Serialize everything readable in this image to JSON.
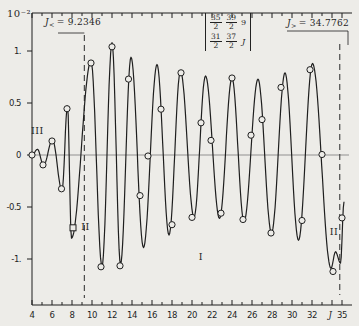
{
  "figure": {
    "scale_label": "10⁻²",
    "left_annotation": {
      "base": "J",
      "sub": "<",
      "rest": "= 9.2346"
    },
    "right_annotation": {
      "base": "J",
      "sub": ">",
      "rest": "= 34.7762"
    },
    "sixj_symbol": {
      "columns": [
        {
          "top": "35/2",
          "bottom": "31/2"
        },
        {
          "top": "39/2",
          "bottom": "37/2"
        },
        {
          "top": "9",
          "bottom": "J"
        }
      ]
    },
    "region_labels": [
      {
        "text": "III",
        "J": 4.55,
        "v": 0.235
      },
      {
        "text": "II",
        "J": 9.35,
        "v": -0.69
      },
      {
        "text": "I",
        "J": 20.9,
        "v": -0.98
      },
      {
        "text": "II",
        "J": 34.2,
        "v": -0.74
      }
    ]
  },
  "chart_data": {
    "type": "line",
    "xlabel": "J",
    "ylabel": "10^-2",
    "xlim": [
      4,
      35
    ],
    "ylim": [
      -1.37,
      1.37
    ],
    "grid": "zero-line only",
    "turning_points": {
      "J_less": 9.2346,
      "J_greater": 34.7762
    },
    "x_ticks_labeled": [
      {
        "label": "4",
        "J": 4
      },
      {
        "label": "6",
        "J": 6
      },
      {
        "label": "8",
        "J": 8
      },
      {
        "label": "10",
        "J": 10
      },
      {
        "label": "12",
        "J": 12
      },
      {
        "label": "14",
        "J": 14
      },
      {
        "label": "16",
        "J": 16
      },
      {
        "label": "18",
        "J": 18
      },
      {
        "label": "20",
        "J": 20
      },
      {
        "label": "22",
        "J": 22
      },
      {
        "label": "24",
        "J": 24
      },
      {
        "label": "26",
        "J": 26
      },
      {
        "label": "28",
        "J": 28
      },
      {
        "label": "30",
        "J": 30
      },
      {
        "label": "32",
        "J": 32
      },
      {
        "label": "J",
        "J": 33.8,
        "italic": true
      },
      {
        "label": "35",
        "J": 35
      }
    ],
    "y_ticks": [
      {
        "label": "1.",
        "v": 1
      },
      {
        "label": "0.5",
        "v": 0.5
      },
      {
        "label": "0",
        "v": 0
      },
      {
        "label": "-0.5",
        "v": -0.5
      },
      {
        "label": "-1.",
        "v": -1
      }
    ],
    "curve_extrema": [
      [
        4.0,
        0.0
      ],
      [
        4.55,
        0.055
      ],
      [
        5.15,
        -0.1
      ],
      [
        6.05,
        0.145
      ],
      [
        7.0,
        -0.34
      ],
      [
        7.55,
        0.47
      ],
      [
        7.95,
        -0.8
      ],
      [
        9.9,
        0.9
      ],
      [
        11.0,
        -1.07
      ],
      [
        12.0,
        1.08
      ],
      [
        12.85,
        -1.05
      ],
      [
        13.9,
        0.94
      ],
      [
        15.15,
        -0.89
      ],
      [
        16.5,
        0.87
      ],
      [
        17.7,
        -0.77
      ],
      [
        18.85,
        0.81
      ],
      [
        20.2,
        -0.6
      ],
      [
        21.35,
        0.76
      ],
      [
        22.75,
        -0.61
      ],
      [
        24.0,
        0.74
      ],
      [
        25.2,
        -0.64
      ],
      [
        26.6,
        0.73
      ],
      [
        27.95,
        -0.75
      ],
      [
        29.3,
        0.79
      ],
      [
        30.65,
        -0.82
      ],
      [
        32.05,
        0.88
      ],
      [
        33.9,
        -1.09
      ],
      [
        34.35,
        -0.93
      ],
      [
        34.85,
        -1.04
      ],
      [
        35.2,
        -0.45
      ]
    ],
    "exact_points": [
      [
        4.0,
        0.0
      ],
      [
        5.1,
        -0.095
      ],
      [
        6.0,
        0.135
      ],
      [
        6.95,
        -0.325
      ],
      [
        7.5,
        0.445
      ],
      [
        9.9,
        0.885
      ],
      [
        10.9,
        -1.075
      ],
      [
        12.0,
        1.04
      ],
      [
        12.8,
        -1.065
      ],
      [
        13.65,
        0.73
      ],
      [
        14.8,
        -0.39
      ],
      [
        15.6,
        -0.01
      ],
      [
        16.9,
        0.44
      ],
      [
        18.0,
        -0.67
      ],
      [
        18.9,
        0.79
      ],
      [
        20.0,
        -0.6
      ],
      [
        20.9,
        0.31
      ],
      [
        21.9,
        0.14
      ],
      [
        22.9,
        -0.56
      ],
      [
        24.0,
        0.74
      ],
      [
        25.1,
        -0.62
      ],
      [
        25.9,
        0.19
      ],
      [
        27.0,
        0.34
      ],
      [
        27.9,
        -0.75
      ],
      [
        28.9,
        0.65
      ],
      [
        31.0,
        -0.63
      ],
      [
        31.8,
        0.82
      ],
      [
        33.0,
        0.005
      ],
      [
        34.1,
        -1.12
      ],
      [
        35.0,
        -0.605
      ]
    ],
    "square_points": [
      [
        8.1,
        -0.7
      ]
    ],
    "colors": {
      "ink": "#1f1f1f",
      "paper": "#edece8",
      "dashed": "#3d3d3d",
      "zero_line": "#6a6a6a"
    }
  }
}
